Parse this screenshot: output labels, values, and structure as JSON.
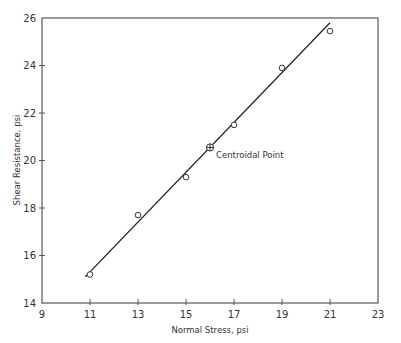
{
  "chart_data": {
    "type": "scatter",
    "title": "",
    "xlabel": "Normal Stress, psi",
    "ylabel": "Shear Resistance, psi",
    "xlim": [
      9,
      23
    ],
    "ylim": [
      14,
      26
    ],
    "xticks": [
      9,
      11,
      13,
      15,
      17,
      19,
      21,
      23
    ],
    "yticks": [
      14,
      16,
      18,
      20,
      22,
      24,
      26
    ],
    "grid": false,
    "legend": null,
    "series": [
      {
        "name": "Observations",
        "marker": "open-circle",
        "x": [
          11,
          13,
          15,
          17,
          19,
          21
        ],
        "y": [
          15.2,
          17.7,
          19.3,
          21.5,
          23.9,
          25.45
        ]
      },
      {
        "name": "Centroidal Point",
        "marker": "circle-plus",
        "x": [
          16
        ],
        "y": [
          20.55
        ]
      },
      {
        "name": "Fitted line",
        "type": "line",
        "x": [
          10.8,
          21.0
        ],
        "y": [
          15.1,
          25.8
        ]
      }
    ],
    "annotations": [
      {
        "text": "Centroidal Point",
        "x": 16,
        "y": 20.55
      }
    ]
  },
  "labels": {
    "xlabel": "Normal Stress, psi",
    "ylabel": "Shear Resistance, psi",
    "centroid": "Centroidal Point"
  },
  "colors": {
    "axis": "#555555",
    "line": "#222222",
    "marker": "#333333",
    "text": "#333333",
    "background": "#ffffff"
  }
}
